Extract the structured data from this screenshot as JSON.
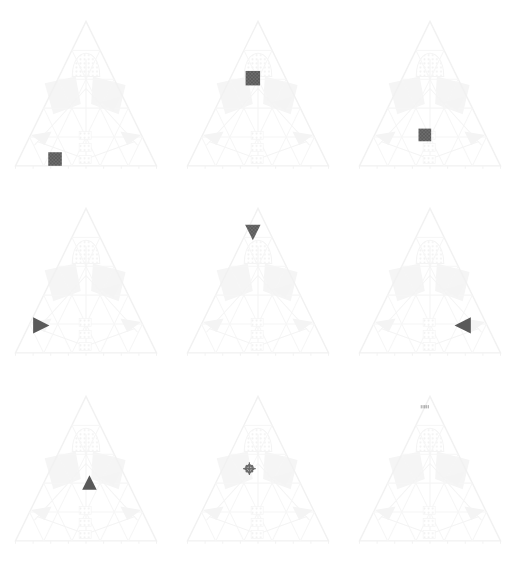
{
  "figure": {
    "title": "",
    "background_color": "#ffffff",
    "width": 516,
    "height": 562,
    "grid_rows": 3,
    "grid_cols": 3
  },
  "style": {
    "marker_color": "#595959",
    "marker_color_light": "#6b6b6b",
    "frame_color": "#f1f1f1",
    "grid_color": "#f6f6f6",
    "hatch_color": "#f5f5f5",
    "ghost_label_color": "#f3f3f3"
  },
  "chart_data": {
    "type": "scatter",
    "title": "",
    "subtitle": "",
    "xlabel": "",
    "ylabel": "",
    "layout": {
      "rows": 3,
      "cols": 3,
      "grid": false,
      "legend": "none"
    },
    "axis_ranges": {
      "a": [
        0,
        100
      ],
      "b": [
        0,
        100
      ],
      "c": [
        0,
        100
      ]
    },
    "panels": [
      {
        "index": 0,
        "row": 0,
        "col": 0,
        "label": "",
        "marker_shape": "square",
        "marker_color": "#595959",
        "marker_size": 15,
        "position_pct": {
          "x": 32,
          "y": 88
        },
        "ternary": {
          "a": 12,
          "b": 56,
          "c": 32
        }
      },
      {
        "index": 1,
        "row": 0,
        "col": 1,
        "label": "",
        "marker_shape": "square",
        "marker_color": "#595959",
        "marker_size": 16,
        "position_pct": {
          "x": 47,
          "y": 41
        },
        "ternary": {
          "a": 59,
          "b": 25,
          "c": 16
        }
      },
      {
        "index": 2,
        "row": 0,
        "col": 2,
        "label": "",
        "marker_shape": "square",
        "marker_color": "#595959",
        "marker_size": 14,
        "position_pct": {
          "x": 47,
          "y": 74
        },
        "ternary": {
          "a": 26,
          "b": 40,
          "c": 34
        }
      },
      {
        "index": 3,
        "row": 1,
        "col": 0,
        "label": "",
        "marker_shape": "triangle-right",
        "marker_color": "#595959",
        "marker_size": 18,
        "position_pct": {
          "x": 24,
          "y": 76
        },
        "ternary": {
          "a": 24,
          "b": 64,
          "c": 12
        }
      },
      {
        "index": 4,
        "row": 1,
        "col": 1,
        "label": "",
        "marker_shape": "triangle-down",
        "marker_color": "#595959",
        "marker_size": 17,
        "position_pct": {
          "x": 47,
          "y": 22
        },
        "ternary": {
          "a": 78,
          "b": 12,
          "c": 10
        }
      },
      {
        "index": 5,
        "row": 1,
        "col": 2,
        "label": "",
        "marker_shape": "triangle-left",
        "marker_color": "#595959",
        "marker_size": 18,
        "position_pct": {
          "x": 69,
          "y": 76
        },
        "ternary": {
          "a": 24,
          "b": 12,
          "c": 64
        }
      },
      {
        "index": 6,
        "row": 2,
        "col": 0,
        "label": "",
        "marker_shape": "triangle-up",
        "marker_color": "#595959",
        "marker_size": 16,
        "position_pct": {
          "x": 52,
          "y": 58
        },
        "ternary": {
          "a": 42,
          "b": 32,
          "c": 26
        }
      },
      {
        "index": 7,
        "row": 2,
        "col": 1,
        "label": "",
        "marker_shape": "cross-dotted",
        "marker_color": "#6b6b6b",
        "marker_size": 14,
        "position_pct": {
          "x": 45,
          "y": 50
        },
        "ternary": {
          "a": 50,
          "b": 29,
          "c": 21
        }
      },
      {
        "index": 8,
        "row": 2,
        "col": 2,
        "label": "",
        "marker_shape": "dash-row",
        "marker_color": "#9a9a9a",
        "marker_size": 9,
        "position_pct": {
          "x": 47,
          "y": 14
        },
        "ternary": {
          "a": 86,
          "b": 7,
          "c": 7
        }
      }
    ]
  }
}
